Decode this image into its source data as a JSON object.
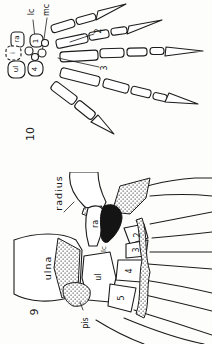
{
  "page": {
    "background": "#fdfdfb",
    "ink": "#1c1c1c"
  },
  "figure10": {
    "number": "10",
    "labels": {
      "lc": "lc",
      "mc": "mc",
      "ra": "ra",
      "intermedium": "i",
      "ul": "ul",
      "carpal1": "1",
      "carpal4": "4",
      "digit2": "2",
      "digit3": "3"
    }
  },
  "figure9": {
    "number": "9",
    "labels": {
      "radius": "radius",
      "ulna": "ulna",
      "pis": "pis",
      "ra": "ra",
      "lc": "lc",
      "ul": "ul",
      "carpal2": "2",
      "carpal3": "3",
      "carpal4": "4",
      "carpal5": "5"
    }
  }
}
